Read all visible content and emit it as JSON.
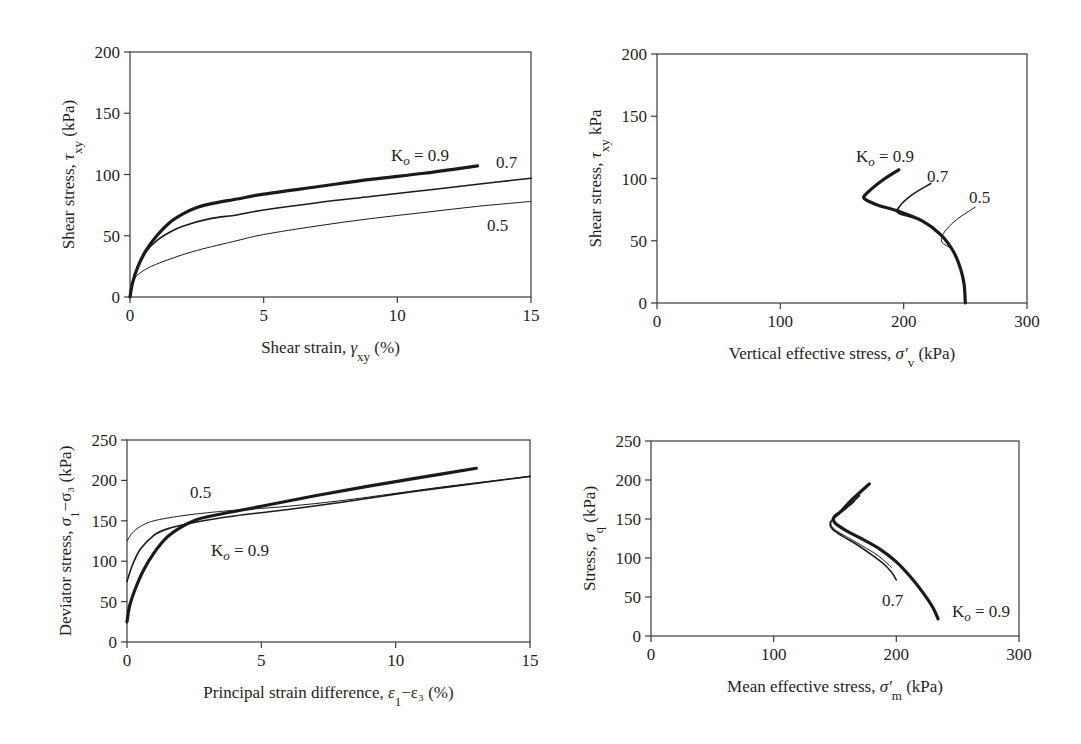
{
  "chart_data": [
    {
      "id": "top-left",
      "type": "line",
      "title": "",
      "xlabel": "Shear strain, γxy (%)",
      "ylabel": "Shear stress, τxy (kPa)",
      "xlim": [
        0,
        15
      ],
      "ylim": [
        0,
        200
      ],
      "xticks": [
        0,
        5,
        10,
        15
      ],
      "yticks": [
        0,
        50,
        100,
        150,
        200
      ],
      "grid": false,
      "legend": "inline annotations",
      "frame_px": {
        "left": 130,
        "top": 52,
        "right": 531,
        "bottom": 297
      },
      "series": [
        {
          "name": "Ko = 0.9",
          "width": 3.2,
          "points": [
            [
              0,
              0
            ],
            [
              0.1,
              12
            ],
            [
              0.3,
              25
            ],
            [
              0.6,
              38
            ],
            [
              1,
              50
            ],
            [
              1.5,
              61
            ],
            [
              2,
              68
            ],
            [
              2.5,
              73
            ],
            [
              3,
              76
            ],
            [
              4,
              80
            ],
            [
              5,
              84
            ],
            [
              7,
              90
            ],
            [
              9,
              96
            ],
            [
              11,
              101
            ],
            [
              13,
              107
            ]
          ]
        },
        {
          "name": "0.7",
          "width": 1.6,
          "points": [
            [
              0,
              0
            ],
            [
              0.1,
              12
            ],
            [
              0.3,
              25
            ],
            [
              0.6,
              37
            ],
            [
              1,
              46
            ],
            [
              1.5,
              53
            ],
            [
              2,
              58
            ],
            [
              3,
              64
            ],
            [
              4,
              67
            ],
            [
              5,
              71
            ],
            [
              7,
              77
            ],
            [
              9,
              82
            ],
            [
              11,
              87
            ],
            [
              13,
              92
            ],
            [
              15,
              97
            ]
          ]
        },
        {
          "name": "0.5",
          "width": 1.0,
          "points": [
            [
              0,
              0
            ],
            [
              0.05,
              8
            ],
            [
              0.2,
              16
            ],
            [
              0.4,
              20
            ],
            [
              0.8,
              25
            ],
            [
              1.5,
              31
            ],
            [
              2.5,
              38
            ],
            [
              4,
              46
            ],
            [
              5,
              51
            ],
            [
              7,
              58
            ],
            [
              9,
              64
            ],
            [
              11,
              69
            ],
            [
              13,
              74
            ],
            [
              15,
              78
            ]
          ]
        }
      ],
      "annotations": [
        {
          "text": "K",
          "sub": "o",
          "rest": " = 0.9",
          "x_px": 391,
          "y_px": 161
        },
        {
          "text": "0.7",
          "x_px": 496,
          "y_px": 168
        },
        {
          "text": "0.5",
          "x_px": 487,
          "y_px": 231
        }
      ]
    },
    {
      "id": "top-right",
      "type": "line",
      "title": "",
      "xlabel": "Vertical effective stress, σ′v (kPa)",
      "ylabel": "Shear stress, τxy kPa",
      "xlim": [
        0,
        300
      ],
      "ylim": [
        0,
        200
      ],
      "xticks": [
        0,
        100,
        200,
        300
      ],
      "yticks": [
        0,
        50,
        100,
        150,
        200
      ],
      "grid": false,
      "legend": "inline annotations",
      "frame_px": {
        "left": 657,
        "top": 54,
        "right": 1027,
        "bottom": 303
      },
      "series": [
        {
          "name": "Ko = 0.9",
          "width": 3.2,
          "points": [
            [
              250,
              0
            ],
            [
              249,
              15
            ],
            [
              246,
              28
            ],
            [
              240,
              42
            ],
            [
              230,
              55
            ],
            [
              215,
              66
            ],
            [
              195,
              74
            ],
            [
              178,
              79
            ],
            [
              168,
              84
            ],
            [
              170,
              88
            ],
            [
              182,
              98
            ],
            [
              196,
              107
            ]
          ]
        },
        {
          "name": "0.7",
          "width": 1.6,
          "points": [
            [
              250,
              0
            ],
            [
              249,
              15
            ],
            [
              246,
              28
            ],
            [
              240,
              42
            ],
            [
              230,
              55
            ],
            [
              215,
              66
            ],
            [
              196,
              72
            ],
            [
              197,
              78
            ],
            [
              207,
              87
            ],
            [
              222,
              96
            ]
          ]
        },
        {
          "name": "0.5",
          "width": 1.0,
          "points": [
            [
              250,
              0
            ],
            [
              249,
              15
            ],
            [
              246,
              28
            ],
            [
              240,
              42
            ],
            [
              231,
              49
            ],
            [
              233,
              57
            ],
            [
              243,
              67
            ],
            [
              258,
              77
            ]
          ]
        }
      ],
      "annotations": [
        {
          "text": "K",
          "sub": "o",
          "rest": " = 0.9",
          "x_px": 856,
          "y_px": 162
        },
        {
          "text": "0.7",
          "x_px": 927,
          "y_px": 182
        },
        {
          "text": "0.5",
          "x_px": 969,
          "y_px": 203
        }
      ]
    },
    {
      "id": "bottom-left",
      "type": "line",
      "title": "",
      "xlabel": "Principal strain difference, ε1−ε3 (%)",
      "ylabel": "Deviator stress, σ1−σ3 (kPa)",
      "xlim": [
        0,
        15
      ],
      "ylim": [
        0,
        250
      ],
      "xticks": [
        0,
        5,
        10,
        15
      ],
      "yticks": [
        0,
        50,
        100,
        150,
        200,
        250
      ],
      "grid": false,
      "legend": "inline annotations",
      "frame_px": {
        "left": 127,
        "top": 440,
        "right": 530,
        "bottom": 642
      },
      "series": [
        {
          "name": "Ko = 0.9",
          "width": 3.2,
          "points": [
            [
              0,
              25
            ],
            [
              0.1,
              45
            ],
            [
              0.3,
              65
            ],
            [
              0.6,
              88
            ],
            [
              1,
              110
            ],
            [
              1.5,
              130
            ],
            [
              2,
              142
            ],
            [
              2.5,
              150
            ],
            [
              3,
              155
            ],
            [
              5,
              168
            ],
            [
              7,
              181
            ],
            [
              9,
              193
            ],
            [
              11,
              204
            ],
            [
              13,
              215
            ]
          ]
        },
        {
          "name": "0.7",
          "width": 1.6,
          "points": [
            [
              0,
              75
            ],
            [
              0.2,
              95
            ],
            [
              0.5,
              115
            ],
            [
              1,
              132
            ],
            [
              1.5,
              140
            ],
            [
              2.5,
              148
            ],
            [
              4,
              156
            ],
            [
              6,
              164
            ],
            [
              8,
              173
            ],
            [
              10,
              183
            ],
            [
              12,
              192
            ],
            [
              15,
              205
            ]
          ]
        },
        {
          "name": "0.5",
          "width": 1.0,
          "points": [
            [
              0,
              125
            ],
            [
              0.2,
              135
            ],
            [
              0.5,
              143
            ],
            [
              1,
              150
            ],
            [
              2,
              156
            ],
            [
              3,
              160
            ],
            [
              4,
              163
            ],
            [
              6,
              168
            ],
            [
              8,
              175
            ],
            [
              10,
              184
            ],
            [
              12,
              193
            ],
            [
              15,
              205
            ]
          ]
        }
      ],
      "annotations": [
        {
          "text": "0.5",
          "x_px": 190,
          "y_px": 498
        },
        {
          "text": "K",
          "sub": "o",
          "rest": " = 0.9",
          "x_px": 211,
          "y_px": 556
        }
      ]
    },
    {
      "id": "bottom-right",
      "type": "line",
      "title": "",
      "xlabel": "Mean effective stress, σ′m (kPa)",
      "ylabel": "Stress, σq (kPa)",
      "xlim": [
        0,
        300
      ],
      "ylim": [
        0,
        250
      ],
      "xticks": [
        0,
        100,
        200,
        300
      ],
      "yticks": [
        0,
        50,
        100,
        150,
        200,
        250
      ],
      "grid": false,
      "legend": "inline annotations",
      "frame_px": {
        "left": 651,
        "top": 441,
        "right": 1019,
        "bottom": 636
      },
      "series": [
        {
          "name": "Ko = 0.9",
          "width": 3.2,
          "points": [
            [
              234,
              22
            ],
            [
              230,
              36
            ],
            [
              222,
              55
            ],
            [
              212,
              75
            ],
            [
              200,
              95
            ],
            [
              186,
              112
            ],
            [
              170,
              126
            ],
            [
              158,
              136
            ],
            [
              150,
              145
            ],
            [
              149,
              152
            ],
            [
              155,
              160
            ],
            [
              164,
              175
            ],
            [
              178,
              195
            ]
          ]
        },
        {
          "name": "0.7",
          "width": 1.6,
          "points": [
            [
              200,
              72
            ],
            [
              196,
              82
            ],
            [
              190,
              92
            ],
            [
              180,
              104
            ],
            [
              168,
              117
            ],
            [
              156,
              128
            ],
            [
              148,
              137
            ],
            [
              146,
              145
            ],
            [
              150,
              152
            ],
            [
              160,
              165
            ],
            [
              170,
              180
            ]
          ]
        },
        {
          "name": "0.5",
          "width": 1.0,
          "points": [
            [
              196,
              88
            ],
            [
              186,
              102
            ],
            [
              174,
              114
            ],
            [
              162,
              125
            ],
            [
              152,
              134
            ],
            [
              147,
              142
            ],
            [
              148,
              150
            ],
            [
              156,
              160
            ],
            [
              166,
              172
            ]
          ]
        }
      ],
      "annotations": [
        {
          "text": "0.7",
          "x_px": 882,
          "y_px": 606
        },
        {
          "text": "K",
          "sub": "o",
          "rest": " = 0.9",
          "x_px": 952,
          "y_px": 617
        }
      ]
    }
  ],
  "figure": {
    "panels": [
      {
        "xlabel_main": "Shear strain, ",
        "xlabel_sym": "γ",
        "xlabel_sub": "xy",
        "xlabel_tail": " (%)",
        "ylabel_main": "Shear stress, ",
        "ylabel_sym": "τ",
        "ylabel_sub": "xy",
        "ylabel_tail": " (kPa)"
      },
      {
        "xlabel_main": "Vertical effective stress, ",
        "xlabel_sym": "σ′",
        "xlabel_sub": "v",
        "xlabel_tail": " (kPa)",
        "ylabel_main": "Shear stress, ",
        "ylabel_sym": "τ",
        "ylabel_sub": "xy",
        "ylabel_tail": " kPa"
      },
      {
        "xlabel_main": "Principal strain difference, ",
        "xlabel_sym": "ε",
        "xlabel_sub": "1",
        "xlabel_tail": "−ε₃ (%)",
        "ylabel_main": "Deviator stress, ",
        "ylabel_sym": "σ",
        "ylabel_sub": "1",
        "ylabel_tail": "−σ₃ (kPa)"
      },
      {
        "xlabel_main": "Mean effective stress, ",
        "xlabel_sym": "σ′",
        "xlabel_sub": "m",
        "xlabel_tail": " (kPa)",
        "ylabel_main": "Stress, ",
        "ylabel_sym": "σ",
        "ylabel_sub": "q",
        "ylabel_tail": " (kPa)"
      }
    ]
  }
}
